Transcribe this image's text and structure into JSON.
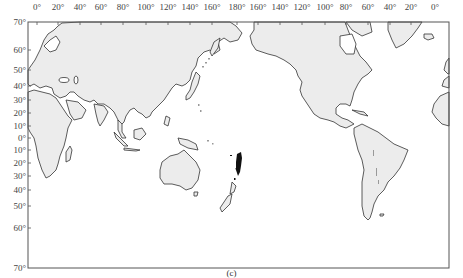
{
  "map": {
    "projection": "Pacific-centered world map",
    "land_color": "#ececec",
    "coast_color": "#333333",
    "marker_color": "#111111",
    "frame": {
      "left": 28,
      "top": 22,
      "right": 449,
      "bottom": 268
    },
    "longitude_labels": [
      {
        "label": "0°",
        "x": 37
      },
      {
        "label": "20°",
        "x": 58
      },
      {
        "label": "40°",
        "x": 80
      },
      {
        "label": "60°",
        "x": 101
      },
      {
        "label": "80°",
        "x": 123
      },
      {
        "label": "100°",
        "x": 146
      },
      {
        "label": "120°",
        "x": 168
      },
      {
        "label": "140°",
        "x": 190
      },
      {
        "label": "160°",
        "x": 212
      },
      {
        "label": "180°",
        "x": 237
      },
      {
        "label": "160°",
        "x": 258
      },
      {
        "label": "140°",
        "x": 280
      },
      {
        "label": "120°",
        "x": 302
      },
      {
        "label": "100°",
        "x": 325
      },
      {
        "label": "80°",
        "x": 346
      },
      {
        "label": "60°",
        "x": 368
      },
      {
        "label": "40°",
        "x": 390
      },
      {
        "label": "20°",
        "x": 411
      },
      {
        "label": "0°",
        "x": 435
      }
    ],
    "latitude_labels": [
      {
        "label": "70°",
        "y": 22
      },
      {
        "label": "60°",
        "y": 50
      },
      {
        "label": "50°",
        "y": 70
      },
      {
        "label": "40°",
        "y": 86
      },
      {
        "label": "30°",
        "y": 100
      },
      {
        "label": "20°",
        "y": 113
      },
      {
        "label": "10°",
        "y": 126
      },
      {
        "label": "0°",
        "y": 138
      },
      {
        "label": "10°",
        "y": 150
      },
      {
        "label": "20°",
        "y": 163
      },
      {
        "label": "30°",
        "y": 176
      },
      {
        "label": "40°",
        "y": 190
      },
      {
        "label": "50°",
        "y": 206
      },
      {
        "label": "60°",
        "y": 228
      },
      {
        "label": "70°",
        "y": 268
      }
    ],
    "highlight_region": "Tonga–Kermadec arc (dense black markers), with scattered grey markers along Japan–Kuril arc, Andes, Southeast Asia and New Zealand"
  },
  "caption": "(c)"
}
